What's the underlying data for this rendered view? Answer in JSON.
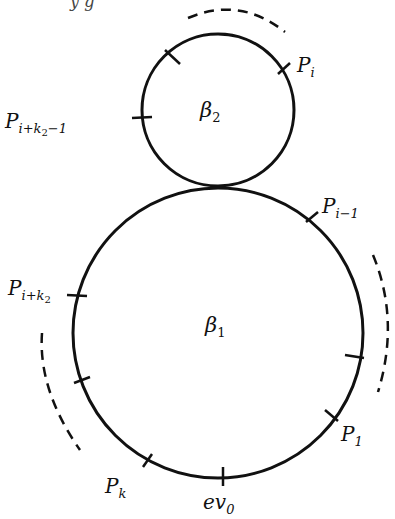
{
  "diagram": {
    "type": "bubble-tree-two-circles",
    "stroke_color": "#111111",
    "background": "#ffffff",
    "top_cut_text": "y  g",
    "circles": [
      {
        "id": "beta2",
        "label_base": "β",
        "label_sub": "2",
        "cx": 218,
        "cy": 110,
        "r": 76
      },
      {
        "id": "beta1",
        "label_base": "β",
        "label_sub": "1",
        "cx": 218,
        "cy": 333,
        "r": 145
      }
    ],
    "points": [
      {
        "name": "P_i",
        "base": "P",
        "sub": "i",
        "subsub": ""
      },
      {
        "name": "P_{i+k2-1}",
        "base": "P",
        "sub": "i+k",
        "subsub": "2",
        "sub_tail": "−1"
      },
      {
        "name": "P_{i-1}",
        "base": "P",
        "sub": "i−1",
        "subsub": ""
      },
      {
        "name": "P_{i+k2}",
        "base": "P",
        "sub": "i+k",
        "subsub": "2"
      },
      {
        "name": "P_1",
        "base": "P",
        "sub": "1",
        "subsub": ""
      },
      {
        "name": "P_k",
        "base": "P",
        "sub": "k",
        "subsub": ""
      },
      {
        "name": "ev_0",
        "base": "ev",
        "sub": "0",
        "subsub": ""
      }
    ]
  }
}
